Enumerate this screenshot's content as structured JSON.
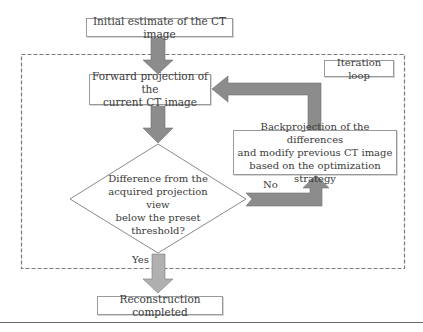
{
  "nodes": {
    "initial": "Initial estimate of the CT image",
    "forward": "Forward projection of the\ncurrent CT image",
    "iteration": "Iteration loop",
    "backprojection": "Backprojection of the differences\nand modify previous CT image\nbased on the optimization strategy",
    "decision": "Difference from the\nacquired projection view\nbelow the preset\nthreshold?",
    "completed": "Reconstruction completed"
  },
  "edges": {
    "no_label": "No",
    "yes_label": "Yes"
  },
  "colors": {
    "arrow_fill": "#8c8c8c",
    "arrow_fill_light": "#b0b0b0",
    "box_border": "#9a9a9a",
    "dashed_border": "#7a7a7a"
  }
}
